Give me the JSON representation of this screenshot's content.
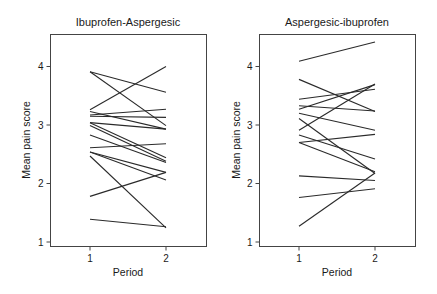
{
  "chart_data": [
    {
      "type": "line",
      "title": "Ibuprofen-Aspergesic",
      "xlabel": "Period",
      "ylabel": "Mean pain score",
      "x": [
        1,
        2
      ],
      "xticks": [
        "1",
        "2"
      ],
      "yticks": [
        "1",
        "2",
        "3",
        "4"
      ],
      "ylim": [
        0.95,
        4.55
      ],
      "xlim": [
        0.48,
        2.55
      ],
      "grid": false,
      "series": [
        {
          "name": "subject-1",
          "values": [
            3.91,
            3.56
          ]
        },
        {
          "name": "subject-2",
          "values": [
            3.91,
            2.99
          ]
        },
        {
          "name": "subject-3",
          "values": [
            3.26,
            4.0
          ]
        },
        {
          "name": "subject-4",
          "values": [
            3.23,
            2.93
          ]
        },
        {
          "name": "subject-5",
          "values": [
            3.17,
            3.27
          ]
        },
        {
          "name": "subject-6",
          "values": [
            3.15,
            3.13
          ]
        },
        {
          "name": "subject-7",
          "values": [
            3.04,
            2.93
          ]
        },
        {
          "name": "subject-8",
          "values": [
            3.04,
            2.44
          ]
        },
        {
          "name": "subject-9",
          "values": [
            2.99,
            2.38
          ]
        },
        {
          "name": "subject-10",
          "values": [
            2.83,
            2.36
          ]
        },
        {
          "name": "subject-11",
          "values": [
            2.61,
            2.68
          ]
        },
        {
          "name": "subject-12",
          "values": [
            2.54,
            2.19
          ]
        },
        {
          "name": "subject-13",
          "values": [
            2.54,
            2.06
          ]
        },
        {
          "name": "subject-14",
          "values": [
            2.47,
            1.24
          ]
        },
        {
          "name": "subject-15",
          "values": [
            1.78,
            2.19
          ]
        },
        {
          "name": "subject-16",
          "values": [
            1.39,
            1.26
          ]
        }
      ]
    },
    {
      "type": "line",
      "title": "Aspergesic-ibuprofen",
      "xlabel": "Period",
      "ylabel": "Mean pain score",
      "x": [
        1,
        2
      ],
      "xticks": [
        "1",
        "2"
      ],
      "yticks": [
        "1",
        "2",
        "3",
        "4"
      ],
      "ylim": [
        0.95,
        4.55
      ],
      "xlim": [
        0.48,
        2.55
      ],
      "grid": false,
      "series": [
        {
          "name": "subject-1",
          "values": [
            4.09,
            4.42
          ]
        },
        {
          "name": "subject-2",
          "values": [
            3.78,
            3.23
          ]
        },
        {
          "name": "subject-3",
          "values": [
            3.44,
            3.61
          ]
        },
        {
          "name": "subject-4",
          "values": [
            3.33,
            3.24
          ]
        },
        {
          "name": "subject-5",
          "values": [
            3.27,
            3.69
          ]
        },
        {
          "name": "subject-6",
          "values": [
            3.2,
            2.91
          ]
        },
        {
          "name": "subject-7",
          "values": [
            3.11,
            2.17
          ]
        },
        {
          "name": "subject-8",
          "values": [
            2.91,
            3.7
          ]
        },
        {
          "name": "subject-9",
          "values": [
            2.83,
            2.42
          ]
        },
        {
          "name": "subject-10",
          "values": [
            2.7,
            2.84
          ]
        },
        {
          "name": "subject-11",
          "values": [
            2.7,
            2.2
          ]
        },
        {
          "name": "subject-12",
          "values": [
            2.13,
            2.05
          ]
        },
        {
          "name": "subject-13",
          "values": [
            1.76,
            1.91
          ]
        },
        {
          "name": "subject-14",
          "values": [
            1.27,
            2.18
          ]
        }
      ]
    }
  ]
}
